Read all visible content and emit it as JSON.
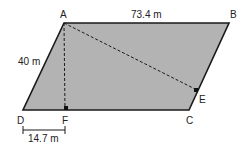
{
  "diagram": {
    "type": "parallelogram",
    "fill_color": "#b3b3b3",
    "stroke_color": "#1a1a1a",
    "vertices": {
      "A": "A",
      "B": "B",
      "C": "C",
      "D": "D",
      "E": "E",
      "F": "F"
    },
    "measures": {
      "AB": "73.4 m",
      "AD": "40 m",
      "DF": "14.7 m"
    },
    "segments": [
      {
        "name": "AF",
        "style": "dashed",
        "perpendicular_to": "DC"
      },
      {
        "name": "AE",
        "style": "dashed",
        "perpendicular_to": "BC"
      }
    ]
  }
}
